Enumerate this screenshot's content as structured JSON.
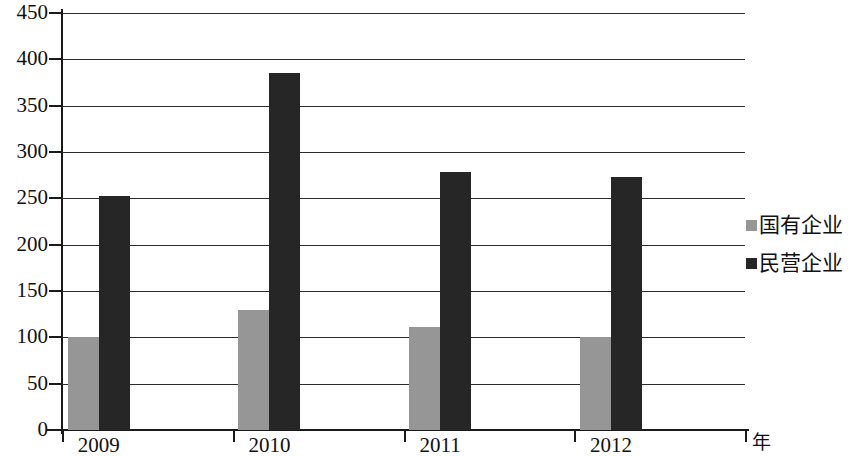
{
  "chart_data": {
    "type": "bar",
    "title": "",
    "subtitle": "",
    "xlabel": "年",
    "ylabel": "",
    "categories": [
      "2009",
      "2010",
      "2011",
      "2012"
    ],
    "series": [
      {
        "name": "国有企业",
        "color": "#969696",
        "values": [
          100,
          130,
          111,
          100
        ]
      },
      {
        "name": "民营企业",
        "color": "#262626",
        "values": [
          252,
          385,
          278,
          273
        ]
      }
    ],
    "ylim": [
      0,
      450
    ],
    "ytick_step": 50,
    "yticks": [
      0,
      50,
      100,
      150,
      200,
      250,
      300,
      350,
      400,
      450
    ],
    "ytick_labels": [
      "0",
      "50",
      "100",
      "150",
      "200",
      "250",
      "300",
      "350",
      "400",
      "450"
    ],
    "grid": true,
    "grid_axis": "y",
    "legend_position": "right",
    "legend_entries": [
      "国有企业",
      "民营企业"
    ],
    "annotations": []
  },
  "axis": {
    "unit_label": "年"
  },
  "colors": {
    "series_state_owned": "#969696",
    "series_private": "#262626",
    "axis": "#1a1a1a",
    "grid": "#2b2b2b",
    "background": "#ffffff"
  }
}
